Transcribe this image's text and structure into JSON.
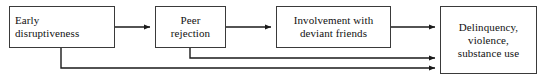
{
  "diagram": {
    "background_color": "#ffffff",
    "stroke_color": "#3a3a3a",
    "edge_color": "#1a1a1a",
    "text_color": "#111111",
    "nodes": [
      {
        "id": "early-disruptiveness",
        "label": "Early\ndisruptiveness",
        "align": "left",
        "x": 9,
        "y": 6,
        "w": 106,
        "h": 42
      },
      {
        "id": "peer-rejection",
        "label": "Peer\nrejection",
        "align": "center",
        "x": 155,
        "y": 6,
        "w": 71,
        "h": 42
      },
      {
        "id": "deviant-friends",
        "label": "Involvement with\ndeviant friends",
        "align": "center",
        "x": 276,
        "y": 6,
        "w": 115,
        "h": 42
      },
      {
        "id": "delinquency-outcomes",
        "label": "Delinquency,\nviolence,\nsubstance use",
        "align": "center",
        "x": 440,
        "y": 6,
        "w": 97,
        "h": 68
      }
    ],
    "edges": [
      {
        "id": "edge-early-to-peer",
        "from": "early-disruptiveness",
        "to": "peer-rejection",
        "kind": "straight",
        "points": "115,27 150,27"
      },
      {
        "id": "edge-peer-to-deviant",
        "from": "peer-rejection",
        "to": "deviant-friends",
        "kind": "straight",
        "points": "226,27 271,27"
      },
      {
        "id": "edge-deviant-to-delinquency",
        "from": "deviant-friends",
        "to": "delinquency-outcomes",
        "kind": "straight",
        "points": "391,27 435,27"
      },
      {
        "id": "edge-peer-to-delinquency",
        "from": "peer-rejection",
        "to": "delinquency-outcomes",
        "kind": "elbow",
        "points": "190,48 190,58 435,58"
      },
      {
        "id": "edge-early-to-delinquency",
        "from": "early-disruptiveness",
        "to": "delinquency-outcomes",
        "kind": "elbow",
        "points": "61,48 61,68 435,68"
      }
    ]
  }
}
